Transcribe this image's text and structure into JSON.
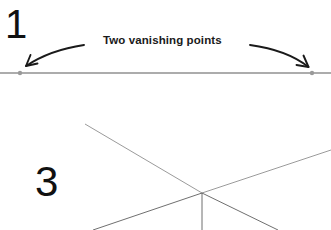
{
  "figure": {
    "background_color": "#ffffff",
    "width": 331,
    "height": 230
  },
  "panels": [
    {
      "id": "panel-one",
      "step_number": "1",
      "caption": "Two vanishing points",
      "description": "Horizon line with two vanishing points indicated by curved arrows",
      "horizon_line": {
        "label": "horizon-line",
        "color": "#5a5a5a",
        "x1": 0,
        "y1": 73,
        "x2": 331,
        "y2": 73,
        "stroke_width": 1.2
      },
      "vanishing_points": [
        {
          "label": "left-vanishing-point",
          "cx": 20,
          "cy": 73,
          "r": 2.2,
          "color": "#9a9a9a"
        },
        {
          "label": "right-vanishing-point",
          "cx": 312,
          "cy": 73,
          "r": 2.2,
          "color": "#9a9a9a"
        }
      ],
      "arrows": [
        {
          "label": "left-pointer-arrow",
          "color": "#1a1a1a",
          "path": "M 84 45 Q 50 50 26 66",
          "head": "M 26 66 L 36 63 M 26 66 L 30 56"
        },
        {
          "label": "right-pointer-arrow",
          "color": "#1a1a1a",
          "path": "M 250 45 Q 286 50 308 67",
          "head": "M 308 67 L 298 65 M 308 67 L 304 57"
        }
      ]
    },
    {
      "id": "panel-three",
      "step_number": "3",
      "caption": "",
      "description": "Five construction lines radiating from a single convergence point",
      "convergence_point": {
        "label": "convergence-point",
        "x": 202,
        "y": 193
      },
      "rays": [
        {
          "label": "ray-upper-left",
          "x1": 85,
          "y1": 124,
          "x2": 202,
          "y2": 193,
          "color": "#8e8e8e",
          "stroke_width": 0.9
        },
        {
          "label": "ray-upper-right",
          "x1": 202,
          "y1": 193,
          "x2": 331,
          "y2": 150,
          "color": "#8e8e8e",
          "stroke_width": 0.9
        },
        {
          "label": "ray-lower-left",
          "x1": 202,
          "y1": 193,
          "x2": 93,
          "y2": 230,
          "color": "#5f5f5f",
          "stroke_width": 0.9
        },
        {
          "label": "ray-lower-right",
          "x1": 202,
          "y1": 193,
          "x2": 278,
          "y2": 230,
          "color": "#5f5f5f",
          "stroke_width": 0.9
        },
        {
          "label": "ray-vertical",
          "x1": 202,
          "y1": 193,
          "x2": 202,
          "y2": 230,
          "color": "#5f5f5f",
          "stroke_width": 0.9
        }
      ]
    }
  ]
}
